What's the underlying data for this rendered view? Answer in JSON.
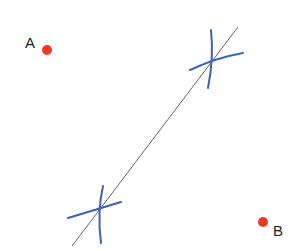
{
  "diagram": {
    "points": [
      {
        "id": "A",
        "label": "A",
        "color": "#f03a1f"
      },
      {
        "id": "B",
        "label": "B",
        "color": "#f03a1f"
      }
    ],
    "bisector_line": {
      "color": "#555555"
    },
    "arc_marks": {
      "color": "#3a63b8",
      "count": 2
    }
  }
}
